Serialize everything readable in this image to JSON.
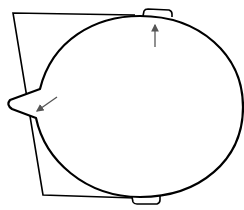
{
  "diagram": {
    "colors": {
      "line": "#000000",
      "arrow": "#555555",
      "background": "#ffffff"
    },
    "elements": [
      {
        "name": "backing-trapezoid",
        "type": "polygon"
      },
      {
        "name": "head-ellipse",
        "type": "ellipse"
      },
      {
        "name": "top-ear-tab",
        "type": "tab"
      },
      {
        "name": "bottom-ear-tab",
        "type": "tab"
      },
      {
        "name": "nose",
        "type": "point"
      },
      {
        "name": "arrow-up",
        "type": "arrow",
        "points_to": "top-ear-tab"
      },
      {
        "name": "arrow-down-left",
        "type": "arrow",
        "points_to": "nose"
      }
    ]
  }
}
